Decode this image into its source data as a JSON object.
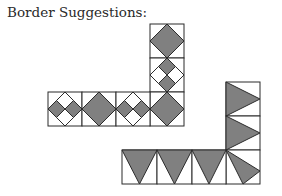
{
  "title": "Border Suggestions:",
  "colors": {
    "fill": "#808080",
    "stroke": "#2b2b2b",
    "background": "#ffffff"
  },
  "borders": [
    {
      "name": "diamond-border",
      "block_size": 34,
      "blocks": [
        {
          "type": "large-diamond",
          "col": 0,
          "row": 0,
          "orientation": "column"
        },
        {
          "type": "four-diamonds-vertical-gray",
          "col": 0,
          "row": 1,
          "orientation": "column"
        },
        {
          "type": "large-diamond",
          "col": 0,
          "row": 2,
          "orientation": "corner"
        },
        {
          "type": "four-diamonds-horizontal-gray",
          "row": 2,
          "orientation": "row"
        },
        {
          "type": "large-diamond",
          "row": 2,
          "orientation": "row"
        },
        {
          "type": "four-diamonds-horizontal-gray",
          "row": 2,
          "orientation": "row"
        }
      ]
    },
    {
      "name": "triangle-border",
      "block_size": 34,
      "blocks": [
        {
          "type": "triangle-right",
          "orientation": "column"
        },
        {
          "type": "triangle-right",
          "orientation": "column"
        },
        {
          "type": "triangle-corner",
          "orientation": "corner"
        },
        {
          "type": "triangle-down",
          "orientation": "row"
        },
        {
          "type": "triangle-down",
          "orientation": "row"
        },
        {
          "type": "triangle-down",
          "orientation": "row"
        }
      ]
    }
  ]
}
